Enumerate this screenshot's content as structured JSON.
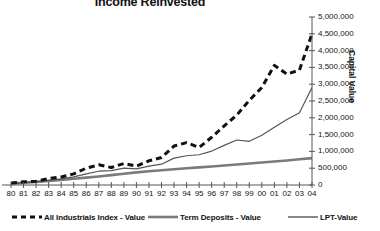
{
  "chart_data": {
    "type": "line",
    "title": "Income Reinvested",
    "xlabel": "",
    "ylabel": "Capital Value",
    "grid": false,
    "legend_position": "bottom",
    "xlim": [
      1980,
      2004
    ],
    "ylim": [
      0,
      5000000
    ],
    "ytick_step": 500000,
    "x": [
      1980,
      1981,
      1982,
      1983,
      1984,
      1985,
      1986,
      1987,
      1988,
      1989,
      1990,
      1991,
      1992,
      1993,
      1994,
      1995,
      1996,
      1997,
      1998,
      1999,
      2000,
      2001,
      2002,
      2003,
      2004
    ],
    "categories": [
      "80",
      "81",
      "82",
      "83",
      "84",
      "85",
      "86",
      "87",
      "88",
      "89",
      "90",
      "91",
      "92",
      "93",
      "94",
      "95",
      "96",
      "97",
      "98",
      "99",
      "00",
      "01",
      "02",
      "03",
      "04"
    ],
    "ytick_labels": [
      "0",
      "500,000",
      "1,000,000",
      "1,500,000",
      "2,000,000",
      "2,500,000",
      "3,000,000",
      "3,500,000",
      "4,000,000",
      "4,500,000",
      "5,000,000"
    ],
    "ytick_values": [
      0,
      500000,
      1000000,
      1500000,
      2000000,
      2500000,
      3000000,
      3500000,
      4000000,
      4500000,
      5000000
    ],
    "series": [
      {
        "name": "All Industrials Index - Value",
        "style": "dashed",
        "color": "#111111",
        "width": 3,
        "values": [
          60000,
          90000,
          105000,
          175000,
          215000,
          300000,
          430000,
          520000,
          470000,
          560000,
          520000,
          640000,
          700000,
          980000,
          1040000,
          980000,
          1200000,
          1480000,
          1720000,
          2070000,
          2380000,
          2620000,
          2980000,
          3320000,
          3580000
        ]
      },
      {
        "name": "Term Deposits - Value",
        "style": "solid",
        "color": "#7a7a7a",
        "width": 2.6,
        "values": [
          40000,
          65000,
          90000,
          120000,
          150000,
          185000,
          220000,
          255000,
          295000,
          335000,
          375000,
          410000,
          440000,
          470000,
          500000,
          525000,
          550000,
          580000,
          610000,
          640000,
          670000,
          700000,
          730000,
          765000,
          800000
        ]
      },
      {
        "name": "LPT-Value",
        "style": "solid",
        "color": "#555555",
        "width": 1.2,
        "values": [
          45000,
          70000,
          100000,
          140000,
          180000,
          240000,
          330000,
          410000,
          430000,
          500000,
          480000,
          560000,
          620000,
          800000,
          870000,
          900000,
          1010000,
          1180000,
          1340000,
          1300000,
          1480000,
          1720000,
          1950000,
          2150000,
          2900000
        ]
      }
    ],
    "series_extra": {
      "all_industrials_detail_x": [
        1980,
        1981,
        1982,
        1983,
        1984,
        1985,
        1986,
        1987,
        1988,
        1989,
        1990,
        1991,
        1992,
        1993,
        1994,
        1995,
        1996,
        1997,
        1998,
        1999,
        2000,
        2001,
        2002,
        2003,
        2004
      ],
      "all_industrials_detail_y": [
        60000,
        95000,
        110000,
        190000,
        240000,
        330000,
        500000,
        600000,
        520000,
        640000,
        560000,
        720000,
        820000,
        1160000,
        1260000,
        1120000,
        1420000,
        1760000,
        2080000,
        2520000,
        2900000,
        3560000,
        3300000,
        3420000,
        4500000
      ]
    }
  },
  "legend": [
    {
      "label": "All Industrials Index - Value",
      "style": "dashed"
    },
    {
      "label": "Term Deposits - Value",
      "style": "solid"
    },
    {
      "label": "LPT-Value",
      "style": "solid"
    }
  ]
}
